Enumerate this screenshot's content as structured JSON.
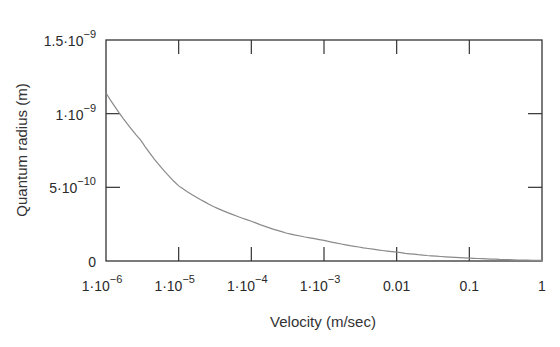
{
  "chart_data": {
    "type": "line",
    "title": "",
    "xlabel": "Velocity (m/sec)",
    "ylabel": "Quantum radius (m)",
    "xscale": "log",
    "xlim": [
      1e-06,
      1
    ],
    "ylim": [
      0,
      1.5e-09
    ],
    "grid": false,
    "legend": null,
    "x_ticks": [
      {
        "base": "1·10",
        "exp": "−6"
      },
      {
        "base": "1·10",
        "exp": "−5"
      },
      {
        "base": "1·10",
        "exp": "−4"
      },
      {
        "base": "1·10",
        "exp": "−3"
      },
      {
        "base": "0.01",
        "exp": ""
      },
      {
        "base": "0.1",
        "exp": ""
      },
      {
        "base": "1",
        "exp": ""
      }
    ],
    "y_ticks": [
      {
        "base": "0",
        "exp": "",
        "value": 0
      },
      {
        "base": "5·10",
        "exp": "−10",
        "value": 5e-10
      },
      {
        "base": "1·10",
        "exp": "−9",
        "value": 1e-09
      },
      {
        "base": "1.5·10",
        "exp": "−9",
        "value": 1.5e-09
      }
    ],
    "series": [
      {
        "name": "Quantum radius",
        "color": "#8a8a8a",
        "x": [
          1e-06,
          3e-06,
          1e-05,
          3e-05,
          0.0001,
          0.0003,
          0.001,
          0.003,
          0.01,
          0.03,
          0.1,
          0.3,
          1
        ],
        "y": [
          1.14e-09,
          8.2e-10,
          5.1e-10,
          3.7e-10,
          2.7e-10,
          1.9e-10,
          1.4e-10,
          9.5e-11,
          6e-11,
          3.5e-11,
          2e-11,
          1e-11,
          4e-12
        ]
      }
    ]
  },
  "colors": {
    "axis": "#333333",
    "line": "#8a8a8a",
    "background": "#ffffff"
  }
}
